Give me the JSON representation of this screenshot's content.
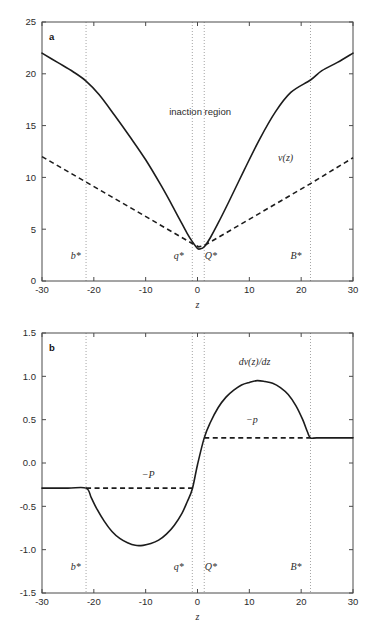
{
  "figure": {
    "panels": [
      {
        "letter": "a",
        "xlabel": "z",
        "annotations": {
          "region": "inaction region",
          "curve": "v(z)"
        }
      },
      {
        "letter": "b",
        "xlabel": "z",
        "annotations": {
          "curve": "dv(z)/dz",
          "upper_bound": "−p",
          "lower_bound": "−P"
        }
      }
    ],
    "threshold_labels": {
      "b_star": "b*",
      "q_star": "q*",
      "Q_star": "Q*",
      "B_star": "B*"
    }
  },
  "chart_data": [
    {
      "type": "line",
      "title": "",
      "panel": "a",
      "xlabel": "z",
      "ylabel": "",
      "xlim": [
        -30,
        30
      ],
      "ylim": [
        0,
        25
      ],
      "xticks": [
        -30,
        -20,
        -10,
        0,
        10,
        20,
        30
      ],
      "xticklabels": [
        "-30",
        "-20",
        "-10",
        "0",
        "10",
        "20",
        "30"
      ],
      "yticks": [
        0,
        5,
        10,
        15,
        20,
        25
      ],
      "yticklabels": [
        "0",
        "5",
        "10",
        "15",
        "20",
        "25"
      ],
      "grid": false,
      "legend": false,
      "annotations": [
        {
          "text": "inaction region",
          "x": 0.5,
          "y": 16.0,
          "style": "plain"
        },
        {
          "text": "v(z)",
          "x": 17.0,
          "y": 11.6,
          "style": "italic"
        },
        {
          "text": "b*",
          "x": -23.5,
          "y": 2.1,
          "style": "italic"
        },
        {
          "text": "q*",
          "x": -3.6,
          "y": 2.1,
          "style": "italic"
        },
        {
          "text": "Q*",
          "x": 2.6,
          "y": 2.1,
          "style": "italic"
        },
        {
          "text": "B*",
          "x": 19.0,
          "y": 2.1,
          "style": "italic"
        }
      ],
      "vertical_lines": [
        {
          "label": "b*",
          "x": -21.5
        },
        {
          "label": "q*",
          "x": -1.0
        },
        {
          "label": "Q*",
          "x": 1.3
        },
        {
          "label": "B*",
          "x": 21.8
        }
      ],
      "series": [
        {
          "name": "v(z)",
          "style": "solid",
          "x": [
            -30,
            -27,
            -24,
            -21.5,
            -19,
            -16,
            -13,
            -10,
            -7,
            -5,
            -3.5,
            -2,
            -1,
            0,
            0.5,
            1.3,
            2.5,
            4,
            6,
            9,
            12,
            15,
            18,
            21.8,
            24,
            27,
            30
          ],
          "y": [
            22.0,
            21.1,
            20.2,
            19.3,
            18.0,
            16.0,
            13.9,
            11.7,
            9.2,
            7.4,
            6.0,
            4.6,
            3.8,
            3.15,
            3.1,
            3.3,
            4.2,
            5.6,
            7.6,
            10.7,
            13.7,
            16.3,
            18.2,
            19.4,
            20.3,
            21.1,
            22.0
          ]
        },
        {
          "name": "tangent-bound",
          "style": "dashed",
          "x": [
            -30,
            -21.5,
            -1.0,
            0.2,
            1.3,
            21.8,
            30
          ],
          "y": [
            12.0,
            9.55,
            3.62,
            3.3,
            3.42,
            9.4,
            11.9
          ]
        }
      ]
    },
    {
      "type": "line",
      "title": "",
      "panel": "b",
      "xlabel": "z",
      "ylabel": "",
      "xlim": [
        -30,
        30
      ],
      "ylim": [
        -1.5,
        1.5
      ],
      "xticks": [
        -30,
        -20,
        -10,
        0,
        10,
        20,
        30
      ],
      "xticklabels": [
        "-30",
        "-20",
        "-10",
        "0",
        "10",
        "20",
        "30"
      ],
      "yticks": [
        -1.5,
        -1.0,
        -0.5,
        0.0,
        0.5,
        1.0,
        1.5
      ],
      "yticklabels": [
        "-1.5",
        "-1.0",
        "-0.5",
        "0.0",
        "0.5",
        "1.0",
        "1.5"
      ],
      "grid": false,
      "legend": false,
      "annotations": [
        {
          "text": "dv(z)/dz",
          "x": 11.0,
          "y": 1.13,
          "style": "italic"
        },
        {
          "text": "−p",
          "x": 10.5,
          "y": 0.46,
          "style": "italic"
        },
        {
          "text": "−P",
          "x": -9.5,
          "y": -0.17,
          "style": "italic"
        },
        {
          "text": "b*",
          "x": -23.5,
          "y": -1.23,
          "style": "italic"
        },
        {
          "text": "q*",
          "x": -3.6,
          "y": -1.23,
          "style": "italic"
        },
        {
          "text": "Q*",
          "x": 2.6,
          "y": -1.23,
          "style": "italic"
        },
        {
          "text": "B*",
          "x": 19.0,
          "y": -1.23,
          "style": "italic"
        }
      ],
      "vertical_lines": [
        {
          "label": "b*",
          "x": -21.5
        },
        {
          "label": "q*",
          "x": -1.0
        },
        {
          "label": "Q*",
          "x": 1.3
        },
        {
          "label": "B*",
          "x": 21.8
        }
      ],
      "series": [
        {
          "name": "dv(z)/dz",
          "style": "solid",
          "x": [
            -30,
            -25,
            -21.5,
            -20.5,
            -19.5,
            -18,
            -16.5,
            -15,
            -13.5,
            -12,
            -10.5,
            -9,
            -7.5,
            -6,
            -4.5,
            -3,
            -2,
            -1,
            0,
            1.3,
            2.5,
            4,
            5.5,
            7,
            8.5,
            10,
            11.5,
            13,
            14.5,
            16,
            17.5,
            19,
            20.3,
            21.2,
            21.8,
            23,
            26,
            30
          ],
          "y": [
            -0.29,
            -0.29,
            -0.29,
            -0.4,
            -0.52,
            -0.67,
            -0.79,
            -0.87,
            -0.92,
            -0.95,
            -0.95,
            -0.93,
            -0.89,
            -0.82,
            -0.72,
            -0.58,
            -0.45,
            -0.3,
            -0.02,
            0.29,
            0.47,
            0.64,
            0.76,
            0.84,
            0.9,
            0.93,
            0.95,
            0.94,
            0.92,
            0.87,
            0.79,
            0.66,
            0.5,
            0.36,
            0.29,
            0.29,
            0.29,
            0.29
          ]
        },
        {
          "name": "-p-level",
          "style": "dashed",
          "x": [
            1.3,
            21.8
          ],
          "y": [
            0.29,
            0.29
          ]
        },
        {
          "name": "-P-level",
          "style": "dashed",
          "x": [
            -21.5,
            -1.0
          ],
          "y": [
            -0.29,
            -0.29
          ]
        }
      ]
    }
  ]
}
